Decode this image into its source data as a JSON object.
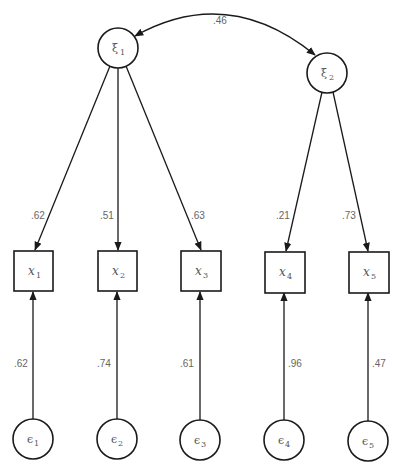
{
  "diagram": {
    "type": "confirmatory factor analysis path diagram",
    "covariance": {
      "from": "xi1",
      "to": "xi2",
      "label": ".46"
    },
    "latent": [
      {
        "id": "xi1",
        "symbol": "ξ",
        "sub": "1",
        "cx": 118,
        "cy": 48
      },
      {
        "id": "xi2",
        "symbol": "ξ",
        "sub": "2",
        "cx": 327,
        "cy": 73
      }
    ],
    "observed": [
      {
        "id": "x1",
        "symbol": "x",
        "sub": "1",
        "cx": 33,
        "cy": 271
      },
      {
        "id": "x2",
        "symbol": "x",
        "sub": "2",
        "cx": 117,
        "cy": 271
      },
      {
        "id": "x3",
        "symbol": "x",
        "sub": "3",
        "cx": 201,
        "cy": 271
      },
      {
        "id": "x4",
        "symbol": "x",
        "sub": "4",
        "cx": 285,
        "cy": 272
      },
      {
        "id": "x5",
        "symbol": "x",
        "sub": "5",
        "cx": 369,
        "cy": 272
      }
    ],
    "errors": [
      {
        "id": "e1",
        "symbol": "ϵ",
        "sub": "1",
        "cx": 33,
        "cy": 439
      },
      {
        "id": "e2",
        "symbol": "ϵ",
        "sub": "2",
        "cx": 117,
        "cy": 439
      },
      {
        "id": "e3",
        "symbol": "ϵ",
        "sub": "3",
        "cx": 200,
        "cy": 440
      },
      {
        "id": "e4",
        "symbol": "ϵ",
        "sub": "4",
        "cx": 284,
        "cy": 440
      },
      {
        "id": "e5",
        "symbol": "ϵ",
        "sub": "5",
        "cx": 368,
        "cy": 441
      }
    ],
    "loadings": [
      {
        "from": "xi1",
        "to": "x1",
        "label": ".62"
      },
      {
        "from": "xi1",
        "to": "x2",
        "label": ".51"
      },
      {
        "from": "xi1",
        "to": "x3",
        "label": ".63"
      },
      {
        "from": "xi2",
        "to": "x4",
        "label": ".21"
      },
      {
        "from": "xi2",
        "to": "x5",
        "label": ".73"
      }
    ],
    "error_paths": [
      {
        "from": "e1",
        "to": "x1",
        "label": ".62"
      },
      {
        "from": "e2",
        "to": "x2",
        "label": ".74"
      },
      {
        "from": "e3",
        "to": "x3",
        "label": ".61"
      },
      {
        "from": "e4",
        "to": "x4",
        "label": ".96"
      },
      {
        "from": "e5",
        "to": "x5",
        "label": ".47"
      }
    ]
  }
}
